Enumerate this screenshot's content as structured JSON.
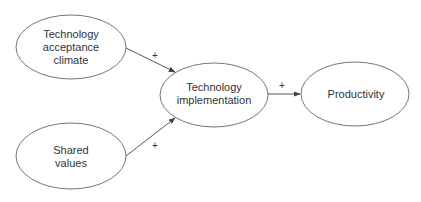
{
  "diagram": {
    "nodes": [
      {
        "id": "tac",
        "label_lines": [
          "Technology",
          "acceptance",
          "climate"
        ]
      },
      {
        "id": "sv",
        "label_lines": [
          "Shared",
          "values"
        ]
      },
      {
        "id": "ti",
        "label_lines": [
          "Technology",
          "implementation"
        ]
      },
      {
        "id": "prod",
        "label_lines": [
          "Productivity"
        ]
      }
    ],
    "edges": [
      {
        "from": "tac",
        "to": "ti",
        "sign": "+"
      },
      {
        "from": "sv",
        "to": "ti",
        "sign": "+"
      },
      {
        "from": "ti",
        "to": "prod",
        "sign": "+"
      }
    ],
    "colors": {
      "stroke": "#555555",
      "text": "#333333"
    }
  }
}
